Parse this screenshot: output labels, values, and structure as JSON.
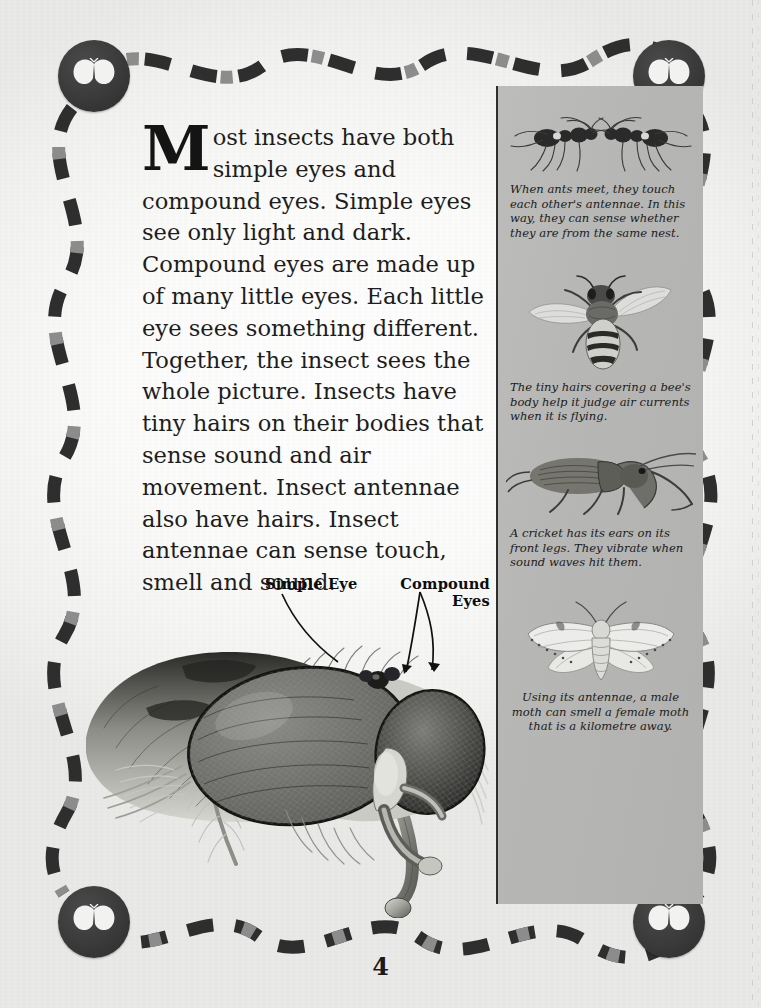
{
  "page": {
    "number": "4",
    "background_color": "#e4e4e2",
    "sheet_color": "#ffffff"
  },
  "article": {
    "dropcap": "M",
    "body": "ost insects have both simple eyes and compound eyes. Simple eyes see only light and dark. Compound eyes are made up of many little eyes. Each little eye sees something different. Together, the insect sees the whole picture. Insects have tiny hairs on their bodies that sense sound and air movement. Insect antennae also have hairs. Insect antennae can sense touch, smell and sound."
  },
  "diagram": {
    "label_simple_eye": "Simple Eye",
    "label_compound_eyes": "Compound Eyes",
    "illustration": "housefly-head-closeup"
  },
  "sidebar": {
    "background_color": "#b6b6b4",
    "panels": [
      {
        "illustration": "two-ants-touching-antennae",
        "caption": "When ants meet, they touch each other's antennae. In this way, they can sense whether they are from the same nest.",
        "align": "left"
      },
      {
        "illustration": "honey-bee-top-view",
        "caption": "The tiny hairs covering a bee's body help it judge air currents when it is flying.",
        "align": "left"
      },
      {
        "illustration": "cricket-side-view",
        "caption": "A cricket has its ears on its front legs. They vibrate when sound waves hit them.",
        "align": "left"
      },
      {
        "illustration": "moth-wings-spread",
        "caption": "Using its antennae, a male moth can smell a female moth that is a kilometre away.",
        "align": "center"
      }
    ]
  },
  "decoration": {
    "border_style": "wavy-dashed-band",
    "dash_dark_color": "#2e2e2e",
    "dash_mid_color": "#8a8a8a",
    "medallion_color": "#3a3a3a",
    "medallion_icon": "butterfly-icon",
    "corners": [
      "top-left",
      "top-right",
      "bottom-left",
      "bottom-right"
    ]
  }
}
